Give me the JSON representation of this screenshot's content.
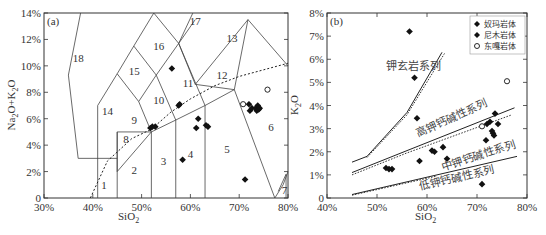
{
  "chart_data": [
    {
      "type": "scatter",
      "panel_label": "(a)",
      "title": "TAS diagram",
      "xlabel": "SiO2",
      "ylabel": "Na2O+K2O",
      "xlim": [
        30,
        80
      ],
      "ylim": [
        0,
        14
      ],
      "x_ticks": [
        "30%",
        "40%",
        "50%",
        "60%",
        "70%",
        "80%"
      ],
      "y_ticks": [
        "0",
        "2%",
        "4%",
        "6%",
        "8%",
        "10%",
        "12%",
        "14%"
      ],
      "field_labels": [
        "1",
        "2",
        "3",
        "4",
        "5",
        "6",
        "7",
        "8",
        "9",
        "10",
        "11",
        "12",
        "13",
        "14",
        "15",
        "16",
        "17",
        "18"
      ],
      "series": [
        {
          "name": "奴玛岩体",
          "marker": "filled-diamond",
          "points": [
            [
              56.2,
              9.8
            ],
            [
              57.6,
              7.0
            ],
            [
              57.8,
              7.1
            ],
            [
              51.8,
              5.3
            ],
            [
              52.2,
              5.4
            ],
            [
              52.8,
              5.4
            ],
            [
              61.2,
              5.3
            ],
            [
              61.6,
              6.0
            ],
            [
              63.2,
              5.5
            ],
            [
              63.6,
              5.4
            ],
            [
              58.4,
              2.9
            ],
            [
              71.2,
              1.4
            ]
          ]
        },
        {
          "name": "尼木岩体",
          "marker": "filled-diamond",
          "points": [
            [
              72.0,
              7.1
            ],
            [
              72.2,
              6.6
            ],
            [
              72.6,
              6.8
            ],
            [
              73.4,
              6.8
            ],
            [
              73.6,
              6.6
            ],
            [
              73.8,
              7.0
            ],
            [
              74.0,
              6.7
            ],
            [
              74.2,
              6.8
            ]
          ]
        },
        {
          "name": "东嘎岩体",
          "marker": "open-circle",
          "points": [
            [
              70.8,
              7.1
            ],
            [
              75.8,
              8.2
            ]
          ]
        }
      ]
    },
    {
      "type": "scatter",
      "panel_label": "(b)",
      "title": "SiO2-K2O diagram",
      "xlabel": "SiO2",
      "ylabel": "K2O",
      "xlim": [
        40,
        80
      ],
      "ylim": [
        0,
        8
      ],
      "x_ticks": [
        "40%",
        "50%",
        "60%",
        "70%",
        "80%"
      ],
      "y_ticks": [
        "0",
        "1%",
        "2%",
        "3%",
        "4%",
        "5%",
        "6%",
        "7%",
        "8%"
      ],
      "legend": [
        "奴玛岩体",
        "尼木岩体",
        "东嘎岩体"
      ],
      "region_labels": [
        "钾玄岩系列",
        "高钾钙碱性系列",
        "中钾钙碱性系列",
        "低钾钙碱性系列"
      ],
      "series": [
        {
          "name": "奴玛岩体",
          "marker": "filled-diamond",
          "points": [
            [
              56.5,
              7.2
            ],
            [
              57.5,
              5.2
            ],
            [
              58.0,
              3.45
            ],
            [
              51.8,
              1.3
            ],
            [
              52.4,
              1.25
            ],
            [
              53.0,
              1.25
            ],
            [
              58.5,
              1.6
            ],
            [
              61.0,
              2.05
            ],
            [
              61.5,
              2.0
            ],
            [
              63.2,
              2.2
            ],
            [
              64.0,
              1.7
            ],
            [
              71.0,
              0.6
            ]
          ]
        },
        {
          "name": "尼木岩体",
          "marker": "filled-diamond",
          "points": [
            [
              71.8,
              2.5
            ],
            [
              72.0,
              3.2
            ],
            [
              72.6,
              3.3
            ],
            [
              73.0,
              2.9
            ],
            [
              73.2,
              2.8
            ],
            [
              73.4,
              2.7
            ],
            [
              73.6,
              3.65
            ],
            [
              74.2,
              3.2
            ]
          ]
        },
        {
          "name": "东嘎岩体",
          "marker": "open-circle",
          "points": [
            [
              71.0,
              3.1
            ],
            [
              76.0,
              5.05
            ]
          ]
        }
      ]
    }
  ],
  "panel_a": {
    "label": "(a)",
    "ylabel_main": "Na",
    "ylabel_sub1": "2",
    "ylabel_mid": "O+K",
    "ylabel_sub2": "2",
    "ylabel_end": "O",
    "xlabel_main": "SiO",
    "xlabel_sub": "2",
    "x_ticks": [
      "30%",
      "40%",
      "50%",
      "60%",
      "70%",
      "80%"
    ],
    "y_ticks": [
      "0",
      "2%",
      "4%",
      "6%",
      "8%",
      "10%",
      "12%",
      "14%"
    ],
    "fields": [
      "1",
      "2",
      "3",
      "4",
      "5",
      "6",
      "7",
      "8",
      "9",
      "10",
      "11",
      "12",
      "13",
      "14",
      "15",
      "16",
      "17",
      "18"
    ]
  },
  "panel_b": {
    "label": "(b)",
    "ylabel_main": "K",
    "ylabel_sub": "2",
    "ylabel_end": "O",
    "xlabel_main": "SiO",
    "xlabel_sub": "2",
    "x_ticks": [
      "40%",
      "50%",
      "60%",
      "70%",
      "80%"
    ],
    "y_ticks": [
      "0",
      "1%",
      "2%",
      "3%",
      "4%",
      "5%",
      "6%",
      "7%",
      "8%"
    ],
    "series_labels": {
      "shoshonite": "钾玄岩系列",
      "high_k": "高钾钙碱性系列",
      "medium_k": "中钾钙碱性系列",
      "low_k": "低钾钙碱性系列"
    },
    "legend": [
      "奴玛岩体",
      "尼木岩体",
      "东嘎岩体"
    ]
  }
}
